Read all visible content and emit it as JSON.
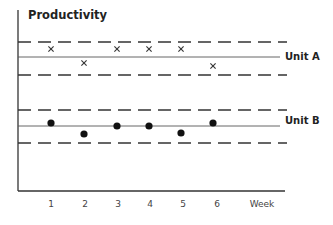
{
  "chart_data": {
    "type": "scatter",
    "title": "Productivity",
    "xlabel": "Week",
    "ylabel": "",
    "categories": [
      "1",
      "2",
      "3",
      "4",
      "5",
      "6"
    ],
    "x": [
      1,
      2,
      3,
      4,
      5,
      6
    ],
    "grid": false,
    "legend": "none (series labeled inline at right end of center lines)",
    "series": [
      {
        "name": "Unit A",
        "marker": "x",
        "values": [
          1,
          -1,
          1,
          1,
          1,
          -1
        ],
        "value_note": "relative position vs. center line (+1 above, -1 below)",
        "control_band": {
          "upper": "dashed",
          "center": "solid",
          "lower": "dashed"
        },
        "pixel_y": [
          49,
          63,
          49,
          49,
          49,
          66
        ]
      },
      {
        "name": "Unit B",
        "marker": "dot",
        "values": [
          1,
          -1,
          0.5,
          0.5,
          -1,
          0.5
        ],
        "value_note": "relative position vs. center line (+ above, - below)",
        "control_band": {
          "upper": "dashed",
          "center": "solid",
          "lower": "dashed"
        },
        "pixel_y": [
          123,
          134,
          126,
          126,
          133,
          123
        ]
      }
    ]
  },
  "labels": {
    "title": "Productivity",
    "x_axis": "Week",
    "ticks": [
      "1",
      "2",
      "3",
      "4",
      "5",
      "6"
    ],
    "series_a": "Unit A",
    "series_b": "Unit B"
  },
  "colors": {
    "ink": "#222222",
    "background": "#ffffff"
  }
}
